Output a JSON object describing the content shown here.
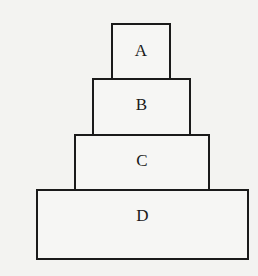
{
  "diagram": {
    "type": "stacked-blocks",
    "blocks": [
      {
        "id": "A",
        "label": "A",
        "level": 1
      },
      {
        "id": "B",
        "label": "B",
        "level": 2
      },
      {
        "id": "C",
        "label": "C",
        "level": 3
      },
      {
        "id": "D",
        "label": "D",
        "level": 4
      }
    ],
    "colors": {
      "stroke": "#1a1a1a",
      "fill": "#f6f6f4",
      "background": "#f3f3f1"
    }
  }
}
